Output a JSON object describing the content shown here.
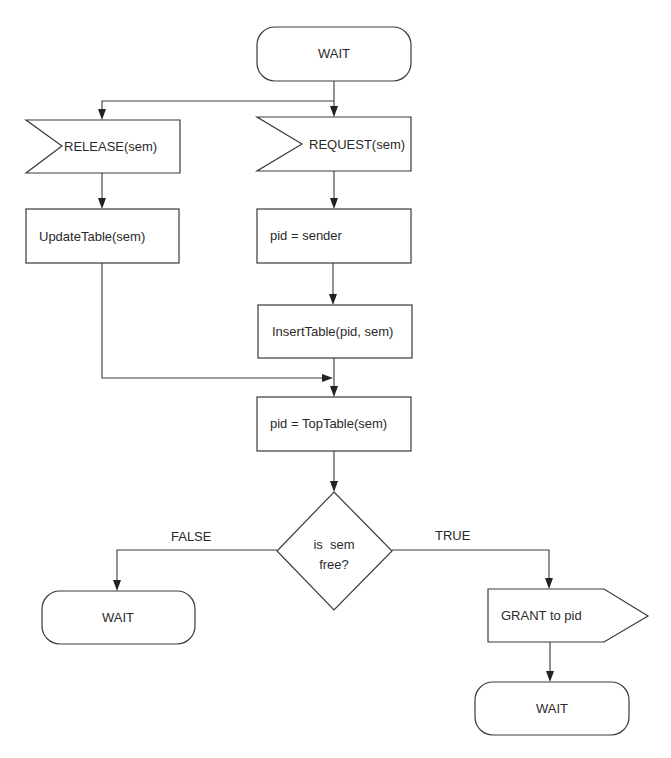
{
  "diagram": {
    "type": "SDL state flowchart",
    "nodes": {
      "wait_top": {
        "kind": "state",
        "label": "WAIT"
      },
      "release": {
        "kind": "input-signal",
        "label": "RELEASE(sem)"
      },
      "request": {
        "kind": "input-signal",
        "label": "REQUEST(sem)"
      },
      "update_table": {
        "kind": "task",
        "label": "UpdateTable(sem)"
      },
      "pid_sender": {
        "kind": "task",
        "label": "pid = sender"
      },
      "insert_table": {
        "kind": "task",
        "label": "InsertTable(pid, sem)"
      },
      "top_table": {
        "kind": "task",
        "label": "pid = TopTable(sem)"
      },
      "decision": {
        "kind": "decision",
        "line1": "is  sem",
        "line2": "free?"
      },
      "wait_false": {
        "kind": "state",
        "label": "WAIT"
      },
      "grant": {
        "kind": "output-signal",
        "label": "GRANT to pid"
      },
      "wait_true": {
        "kind": "state",
        "label": "WAIT"
      }
    },
    "edge_labels": {
      "false": "FALSE",
      "true": "TRUE"
    },
    "edges": [
      [
        "wait_top",
        "release"
      ],
      [
        "wait_top",
        "request"
      ],
      [
        "release",
        "update_table"
      ],
      [
        "request",
        "pid_sender"
      ],
      [
        "pid_sender",
        "insert_table"
      ],
      [
        "update_table",
        "top_table"
      ],
      [
        "insert_table",
        "top_table"
      ],
      [
        "top_table",
        "decision"
      ],
      [
        "decision",
        "wait_false"
      ],
      [
        "decision",
        "grant"
      ],
      [
        "grant",
        "wait_true"
      ]
    ],
    "colors": {
      "stroke": "#3a3a3a",
      "background": "#ffffff",
      "text": "#2a2a2a"
    }
  }
}
